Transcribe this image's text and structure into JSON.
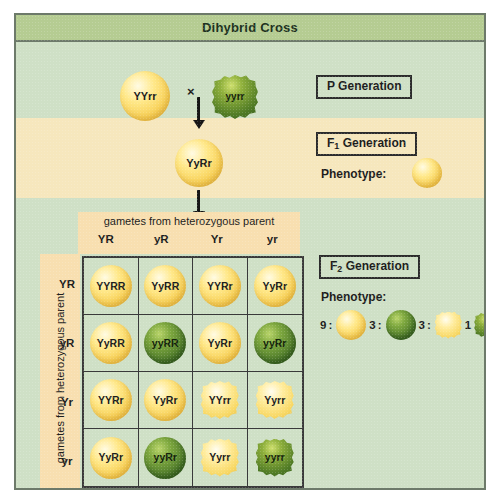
{
  "figure": {
    "title": "Dihybrid Cross"
  },
  "p_generation": {
    "box_label": "P Generation",
    "parent_a": {
      "genotype": "YYrr",
      "color": "yellow",
      "shape": "round"
    },
    "cross_symbol": "×",
    "parent_b": {
      "genotype": "yyrr",
      "color": "green",
      "shape": "wrinkled"
    }
  },
  "f1_generation": {
    "box_label_text": "Generation",
    "box_label_prefix": "F",
    "box_label_sub": "1",
    "offspring_genotype": "YyRr",
    "phenotype_label": "Phenotype:",
    "phenotype": {
      "color": "yellow",
      "shape": "round"
    }
  },
  "punnett": {
    "top_caption": "gametes from heterozygous parent",
    "side_caption": "gametes from heterozygous parent",
    "column_headers": [
      "YR",
      "yR",
      "Yr",
      "yr"
    ],
    "row_headers": [
      "YR",
      "yR",
      "Yr",
      "yr"
    ],
    "cells": [
      [
        {
          "genotype": "YYRR",
          "color": "yellow",
          "shape": "round"
        },
        {
          "genotype": "YyRR",
          "color": "yellow",
          "shape": "round"
        },
        {
          "genotype": "YYRr",
          "color": "yellow",
          "shape": "round"
        },
        {
          "genotype": "YyRr",
          "color": "yellow",
          "shape": "round"
        }
      ],
      [
        {
          "genotype": "YyRR",
          "color": "yellow",
          "shape": "round"
        },
        {
          "genotype": "yyRR",
          "color": "green",
          "shape": "round"
        },
        {
          "genotype": "YyRr",
          "color": "yellow",
          "shape": "round"
        },
        {
          "genotype": "yyRr",
          "color": "green",
          "shape": "round"
        }
      ],
      [
        {
          "genotype": "YYRr",
          "color": "yellow",
          "shape": "round"
        },
        {
          "genotype": "YyRr",
          "color": "yellow",
          "shape": "round"
        },
        {
          "genotype": "YYrr",
          "color": "yellow",
          "shape": "wrinkled"
        },
        {
          "genotype": "Yyrr",
          "color": "yellow",
          "shape": "wrinkled"
        }
      ],
      [
        {
          "genotype": "YyRr",
          "color": "yellow",
          "shape": "round"
        },
        {
          "genotype": "yyRr",
          "color": "green",
          "shape": "round"
        },
        {
          "genotype": "Yyrr",
          "color": "yellow",
          "shape": "wrinkled"
        },
        {
          "genotype": "yyrr",
          "color": "green",
          "shape": "wrinkled"
        }
      ]
    ]
  },
  "f2_generation": {
    "box_label_text": "Generation",
    "box_label_prefix": "F",
    "box_label_sub": "2",
    "phenotype_label": "Phenotype:",
    "ratio": [
      {
        "count": "9",
        "separator": ":",
        "color": "yellow",
        "shape": "round"
      },
      {
        "count": "3",
        "separator": ":",
        "color": "green",
        "shape": "round"
      },
      {
        "count": "3",
        "separator": ":",
        "color": "yellow",
        "shape": "wrinkled"
      },
      {
        "count": "1",
        "separator": "",
        "color": "green",
        "shape": "wrinkled"
      }
    ]
  },
  "colors": {
    "page_background": "#ffffff",
    "panel_background": "#cfe0c6",
    "title_bar": "#b5cc92",
    "f1_band": "#f6e7bd",
    "gamete_strip": "#f8dfb0",
    "frame_border": "#6d7a6a",
    "grid_line": "#3a3a3a",
    "seed_yellow": "#f7cf55",
    "seed_green": "#4e7a2b",
    "text": "#1d1d1d"
  }
}
